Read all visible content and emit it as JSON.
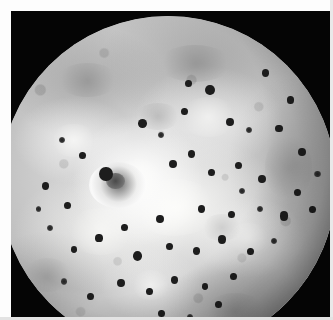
{
  "image": {
    "subject": "Io",
    "kind": "photograph",
    "palette": "grayscale",
    "background_color": "#050505",
    "border_color": "#fdfdfd",
    "alt": "Grayscale spacecraft photograph of Jupiter's volcanic moon Io, a nearly full disk filling the frame against black space, showing bright plains, mottled gray terrain and many small dark volcanic spots."
  },
  "frame": {
    "width": 333,
    "height": 320,
    "border_top": 11,
    "border_left": 11,
    "border_right": 3,
    "border_bottom": 3
  },
  "disk": {
    "center_x": 157,
    "center_y": 173,
    "radius": 168,
    "base_color": "#cfcfcf",
    "bright_color": "#f4f4f2",
    "mid_color": "#9a9a9a",
    "dark_color": "#5e5e5e",
    "spot_color": "#1d1d1d"
  },
  "features": {
    "plume_deposit": {
      "label": "bright-ringed volcanic plume deposit",
      "x": 34,
      "y": 50
    },
    "spots": [
      {
        "x": 62.5,
        "y": 22.0,
        "r": 1.5
      },
      {
        "x": 56.0,
        "y": 20.0,
        "r": 1.0
      },
      {
        "x": 79.0,
        "y": 17.0,
        "r": 1.1
      },
      {
        "x": 86.5,
        "y": 25.0,
        "r": 1.0
      },
      {
        "x": 42.5,
        "y": 32.0,
        "r": 1.3
      },
      {
        "x": 48.0,
        "y": 35.5,
        "r": 0.9
      },
      {
        "x": 55.0,
        "y": 28.5,
        "r": 1.0
      },
      {
        "x": 68.5,
        "y": 31.5,
        "r": 1.2
      },
      {
        "x": 74.0,
        "y": 34.0,
        "r": 0.9
      },
      {
        "x": 83.0,
        "y": 33.5,
        "r": 1.1
      },
      {
        "x": 90.0,
        "y": 40.5,
        "r": 1.2
      },
      {
        "x": 24.5,
        "y": 41.5,
        "r": 1.0
      },
      {
        "x": 18.5,
        "y": 37.0,
        "r": 0.9
      },
      {
        "x": 13.5,
        "y": 50.5,
        "r": 1.1
      },
      {
        "x": 20.0,
        "y": 56.5,
        "r": 1.0
      },
      {
        "x": 31.5,
        "y": 47.0,
        "r": 2.0
      },
      {
        "x": 51.5,
        "y": 44.0,
        "r": 1.2
      },
      {
        "x": 57.0,
        "y": 41.0,
        "r": 1.1
      },
      {
        "x": 63.0,
        "y": 46.5,
        "r": 1.0
      },
      {
        "x": 71.0,
        "y": 44.5,
        "r": 1.1
      },
      {
        "x": 78.0,
        "y": 48.5,
        "r": 1.2
      },
      {
        "x": 88.5,
        "y": 52.5,
        "r": 1.1
      },
      {
        "x": 93.0,
        "y": 57.5,
        "r": 1.0
      },
      {
        "x": 84.5,
        "y": 59.5,
        "r": 1.3
      },
      {
        "x": 77.5,
        "y": 57.5,
        "r": 0.9
      },
      {
        "x": 69.0,
        "y": 59.0,
        "r": 1.0
      },
      {
        "x": 60.0,
        "y": 57.5,
        "r": 1.1
      },
      {
        "x": 47.5,
        "y": 60.5,
        "r": 1.2
      },
      {
        "x": 37.0,
        "y": 63.0,
        "r": 1.0
      },
      {
        "x": 29.5,
        "y": 66.0,
        "r": 1.1
      },
      {
        "x": 22.0,
        "y": 69.5,
        "r": 1.0
      },
      {
        "x": 15.0,
        "y": 63.0,
        "r": 0.9
      },
      {
        "x": 41.0,
        "y": 71.5,
        "r": 1.4
      },
      {
        "x": 50.5,
        "y": 68.5,
        "r": 1.0
      },
      {
        "x": 58.5,
        "y": 70.0,
        "r": 1.1
      },
      {
        "x": 66.0,
        "y": 66.5,
        "r": 1.2
      },
      {
        "x": 74.5,
        "y": 70.0,
        "r": 1.0
      },
      {
        "x": 81.5,
        "y": 67.0,
        "r": 0.9
      },
      {
        "x": 36.0,
        "y": 79.5,
        "r": 1.2
      },
      {
        "x": 44.5,
        "y": 82.0,
        "r": 1.0
      },
      {
        "x": 52.0,
        "y": 78.5,
        "r": 1.1
      },
      {
        "x": 61.0,
        "y": 80.5,
        "r": 1.0
      },
      {
        "x": 69.5,
        "y": 77.5,
        "r": 1.1
      },
      {
        "x": 27.0,
        "y": 83.5,
        "r": 1.0
      },
      {
        "x": 19.0,
        "y": 79.0,
        "r": 0.9
      },
      {
        "x": 48.0,
        "y": 88.5,
        "r": 1.0
      },
      {
        "x": 56.5,
        "y": 89.5,
        "r": 0.9
      },
      {
        "x": 33.0,
        "y": 91.0,
        "r": 0.9
      },
      {
        "x": 65.0,
        "y": 86.0,
        "r": 1.0
      },
      {
        "x": 72.0,
        "y": 52.0,
        "r": 0.9
      },
      {
        "x": 94.5,
        "y": 47.0,
        "r": 0.9
      },
      {
        "x": 11.5,
        "y": 57.5,
        "r": 0.8
      }
    ],
    "dark_patches": [
      {
        "x": 58,
        "y": 14,
        "w": 22,
        "h": 11,
        "o": 0.3
      },
      {
        "x": 26,
        "y": 19,
        "w": 18,
        "h": 10,
        "o": 0.28
      },
      {
        "x": 86,
        "y": 45,
        "w": 14,
        "h": 20,
        "o": 0.24
      },
      {
        "x": 70,
        "y": 88,
        "w": 18,
        "h": 11,
        "o": 0.26
      },
      {
        "x": 14,
        "y": 77,
        "w": 14,
        "h": 10,
        "o": 0.22
      },
      {
        "x": 47,
        "y": 30,
        "w": 13,
        "h": 8,
        "o": 0.26
      },
      {
        "x": 66,
        "y": 63,
        "w": 12,
        "h": 8,
        "o": 0.2
      }
    ],
    "bright_patches": [
      {
        "x": 41,
        "y": 49,
        "w": 16,
        "h": 13,
        "o": 0.8
      },
      {
        "x": 52,
        "y": 57,
        "w": 26,
        "h": 17,
        "o": 0.62
      },
      {
        "x": 30,
        "y": 64,
        "w": 20,
        "h": 14,
        "o": 0.5
      },
      {
        "x": 62,
        "y": 30,
        "w": 17,
        "h": 12,
        "o": 0.45
      },
      {
        "x": 22,
        "y": 37,
        "w": 14,
        "h": 10,
        "o": 0.52
      },
      {
        "x": 74,
        "y": 66,
        "w": 13,
        "h": 9,
        "o": 0.4
      },
      {
        "x": 45,
        "y": 80,
        "w": 12,
        "h": 9,
        "o": 0.45
      }
    ]
  }
}
